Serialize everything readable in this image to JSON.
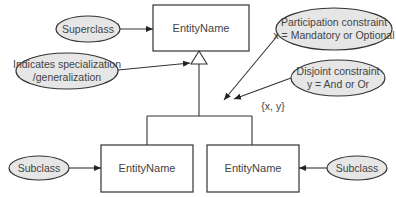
{
  "diagram": {
    "type": "EER specialization/generalization notation",
    "entities": {
      "superclass": {
        "label": "EntityName"
      },
      "subclass_left": {
        "label": "EntityName"
      },
      "subclass_right": {
        "label": "EntityName"
      }
    },
    "constraint_label": "{x, y}",
    "annotations": {
      "superclass": {
        "lines": [
          "Superclass"
        ]
      },
      "specialization": {
        "lines": [
          "Indicates specialization",
          "/generalization"
        ]
      },
      "participation": {
        "lines": [
          "Participation constraint",
          "x = Mandatory or Optional"
        ]
      },
      "disjoint": {
        "lines": [
          "Disjoint constraint",
          "y = And or Or"
        ]
      },
      "subclass_left": {
        "lines": [
          "Subclass"
        ]
      },
      "subclass_right": {
        "lines": [
          "Subclass"
        ]
      }
    },
    "colors": {
      "line": "#333333",
      "ellipse_fill": "#e6e6e6",
      "box_fill": "#ffffff",
      "text": "#444444"
    }
  }
}
